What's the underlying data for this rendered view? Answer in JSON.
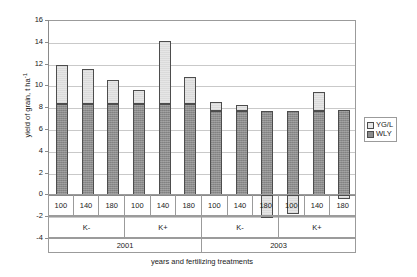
{
  "chart_data": {
    "type": "bar",
    "stacked": true,
    "title": "",
    "xlabel": "years and fertilizing treatments",
    "ylabel": "yield of grain, t ha",
    "ylabel_exponent": "-1",
    "ylim": [
      -4,
      16
    ],
    "ytick_step": 2,
    "yticks": [
      "16",
      "14",
      "12",
      "10",
      "8",
      "6",
      "4",
      "2",
      "0",
      "-2",
      "-4"
    ],
    "grid": true,
    "legend_position": "right",
    "categories": [
      "100",
      "140",
      "180",
      "100",
      "140",
      "180",
      "100",
      "140",
      "180",
      "100",
      "140",
      "180"
    ],
    "group_level_1": [
      {
        "label": "K-",
        "span": 3
      },
      {
        "label": "K+",
        "span": 3
      },
      {
        "label": "K-",
        "span": 3
      },
      {
        "label": "K+",
        "span": 3
      }
    ],
    "group_level_2": [
      {
        "label": "2001",
        "span": 6
      },
      {
        "label": "2003",
        "span": 6
      }
    ],
    "series": [
      {
        "name": "WLY",
        "color": "#8c8c8c",
        "values": [
          8.35,
          8.35,
          8.35,
          8.4,
          8.4,
          8.4,
          7.75,
          7.75,
          7.75,
          7.75,
          7.75,
          7.8
        ]
      },
      {
        "name": "YG/L",
        "color": "#e6e6e6",
        "values": [
          3.6,
          3.25,
          2.2,
          1.3,
          5.8,
          2.45,
          0.8,
          0.5,
          -2.05,
          -1.75,
          1.75,
          -0.35
        ]
      }
    ],
    "totals": [
      11.95,
      11.6,
      10.55,
      9.7,
      14.2,
      10.85,
      8.55,
      8.25,
      7.75,
      7.75,
      9.5,
      7.8
    ]
  },
  "legend": {
    "entries": [
      {
        "label": "YG/L",
        "swatch": "#e6e6e6"
      },
      {
        "label": "WLY",
        "swatch": "#8c8c8c"
      }
    ]
  }
}
